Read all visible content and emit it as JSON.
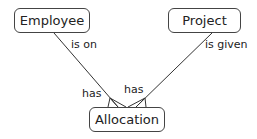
{
  "entities": [
    {
      "id": "employee",
      "label": "Employee"
    },
    {
      "id": "project",
      "label": "Project"
    },
    {
      "id": "allocation",
      "label": "Allocation"
    }
  ],
  "relationships": [
    {
      "from": "employee",
      "to": "allocation",
      "label_near_parent": "is on",
      "label_near_child": "has",
      "cardinality": "one-to-many"
    },
    {
      "from": "project",
      "to": "allocation",
      "label_near_parent": "is given",
      "label_near_child": "has",
      "cardinality": "one-to-many"
    }
  ]
}
